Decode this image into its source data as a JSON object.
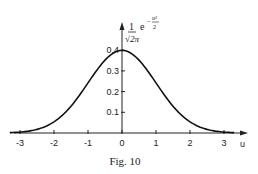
{
  "chart_data": {
    "type": "line",
    "title": "",
    "caption": "Fig. 10",
    "xlabel": "u",
    "ylabel": "1/√(2π) e^(-u²/2)",
    "ylabel_parts": {
      "numerator": "1",
      "denominator": "√2π",
      "base": "e",
      "exponent_num": "u²",
      "exponent_den": "2",
      "minus": "−"
    },
    "x_ticks": [
      "-3",
      "-2",
      "-1",
      "0",
      "1",
      "2",
      "3"
    ],
    "y_ticks": [
      "0.1",
      "0.2",
      "0.3",
      "0.4"
    ],
    "xlim": [
      -3.3,
      3.5
    ],
    "ylim": [
      0,
      0.42
    ],
    "grid": false,
    "series": [
      {
        "name": "standard normal density",
        "x": [
          -3,
          -2.5,
          -2,
          -1.5,
          -1,
          -0.5,
          0,
          0.5,
          1,
          1.5,
          2,
          2.5,
          3
        ],
        "values": [
          0.0044,
          0.0175,
          0.054,
          0.1295,
          0.242,
          0.352,
          0.399,
          0.352,
          0.242,
          0.1295,
          0.054,
          0.0175,
          0.0044
        ]
      }
    ]
  }
}
